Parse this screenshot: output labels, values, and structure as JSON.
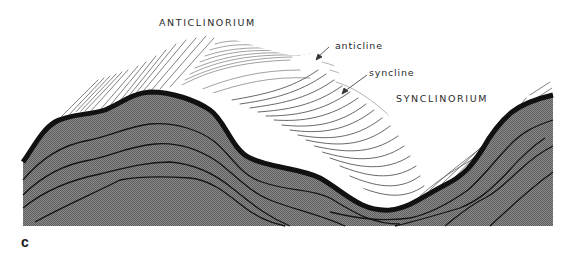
{
  "figure": {
    "panel_letter": "c",
    "type": "geologic block diagram",
    "labels": {
      "anticlinorium": "ANTICLINORIUM",
      "anticline": "anticline",
      "syncline": "syncline",
      "synclinorium": "SYNCLINORIUM"
    },
    "colors": {
      "background": "#ffffff",
      "cross_section_fill": "#7a7a7a",
      "strata_lines": "#1a1a1a",
      "top_bed": "#111111",
      "surface_hachure": "#333333",
      "text": "#2a2a2a"
    }
  }
}
